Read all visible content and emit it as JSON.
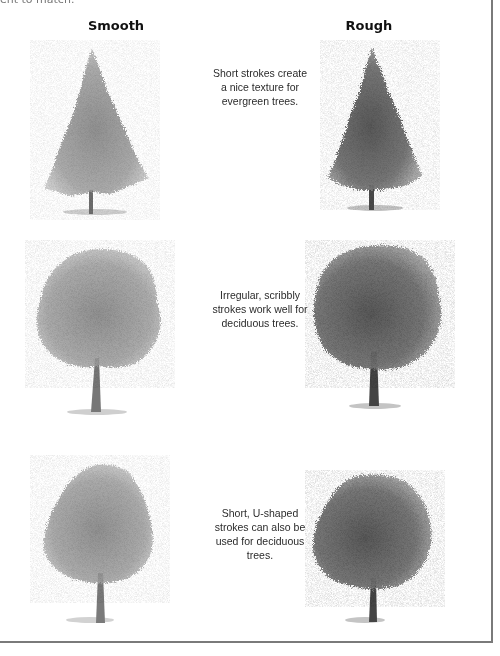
{
  "clipped_text": "ent to match.",
  "columns": {
    "smooth": "Smooth",
    "rough": "Rough"
  },
  "rows": [
    {
      "tree_type": "evergreen",
      "caption_lines": [
        "Short strokes create",
        "a nice texture for",
        "evergreen trees."
      ]
    },
    {
      "tree_type": "deciduous",
      "caption_lines": [
        "Irregular, scribbly",
        "strokes work well for",
        "deciduous trees."
      ]
    },
    {
      "tree_type": "deciduous",
      "caption_lines": [
        "Short, U-shaped",
        "strokes can also be",
        "used for deciduous",
        "trees."
      ]
    }
  ],
  "colors": {
    "frame": "#7a7a7a",
    "text": "#2b2b2b",
    "graphite_light": "#b5b5b5",
    "graphite_mid": "#8a8a8a",
    "graphite_dark": "#4a4a4a"
  }
}
